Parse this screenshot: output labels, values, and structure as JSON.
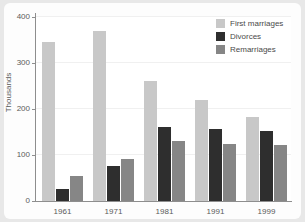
{
  "chart_data": {
    "type": "bar",
    "title": "",
    "subtitle": "",
    "xlabel": "",
    "ylabel": "Thousands",
    "categories": [
      "1961",
      "1971",
      "1981",
      "1991",
      "1999"
    ],
    "series": [
      {
        "name": "First marriages",
        "color": "#c8c8c8",
        "values": [
          345,
          369,
          260,
          219,
          182
        ]
      },
      {
        "name": "Divorces",
        "color": "#2e2e2e",
        "values": [
          27,
          77,
          160,
          156,
          152
        ]
      },
      {
        "name": "Remarriages",
        "color": "#868686",
        "values": [
          54,
          91,
          131,
          125,
          122
        ]
      }
    ],
    "ylim": [
      0,
      400
    ],
    "yticks": [
      0,
      100,
      200,
      300,
      400
    ],
    "ytick_labels": [
      "0",
      "100",
      "200",
      "300",
      "400"
    ],
    "grid": true,
    "grid_axis": "y",
    "legend_position": "top-right",
    "annotations": []
  },
  "legend": {
    "items": [
      {
        "label": "First marriages",
        "color": "#c8c8c8"
      },
      {
        "label": "Divorces",
        "color": "#2e2e2e"
      },
      {
        "label": "Remarriages",
        "color": "#868686"
      }
    ]
  },
  "colors": {
    "figure_background": "#e8e8e8",
    "panel_background": "#fdfdfd",
    "plot_background": "#ffffff",
    "axis": "#8e8e8e",
    "gridline": "#f0f0f0",
    "tick_text": "#5a5a5a"
  }
}
